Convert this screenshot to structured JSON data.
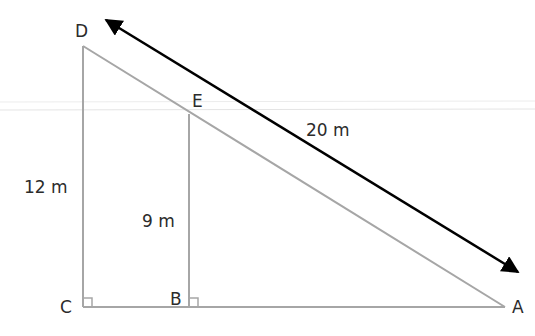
{
  "diagram": {
    "type": "similar-triangles",
    "points": {
      "D": {
        "label": "D"
      },
      "E": {
        "label": "E"
      },
      "C": {
        "label": "C"
      },
      "B": {
        "label": "B"
      },
      "A": {
        "label": "A"
      }
    },
    "measurements": {
      "DA": "20 m",
      "DC": "12 m",
      "EB": "9 m"
    },
    "right_angles": [
      "C",
      "B"
    ],
    "colors": {
      "triangle_stroke": "#a6a6a6",
      "arrow_stroke": "#000000",
      "label_text": "#2b2b2b",
      "faint_guides": "#e6e6e6"
    }
  }
}
